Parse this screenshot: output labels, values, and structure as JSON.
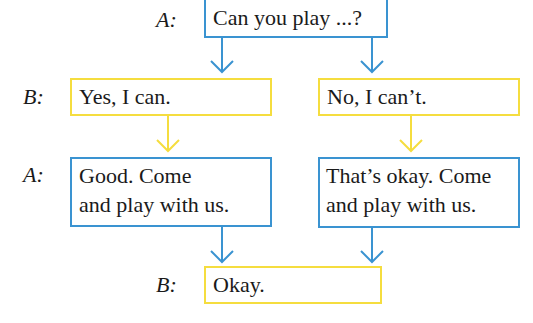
{
  "colors": {
    "speaker_a_box": "#3a93d1",
    "speaker_b_box": "#f5dd3f"
  },
  "speaker_labels": {
    "a_top": "A:",
    "b_middle": "B:",
    "a_middle": "A:",
    "b_bottom": "B:"
  },
  "boxes": {
    "question": "Can you play ...?",
    "yes": "Yes, I can.",
    "no": "No, I can’t.",
    "good_line1": "Good. Come",
    "good_line2": "and play with us.",
    "okay_line1": "That’s okay. Come",
    "okay_line2": "and play with us.",
    "final": "Okay."
  }
}
